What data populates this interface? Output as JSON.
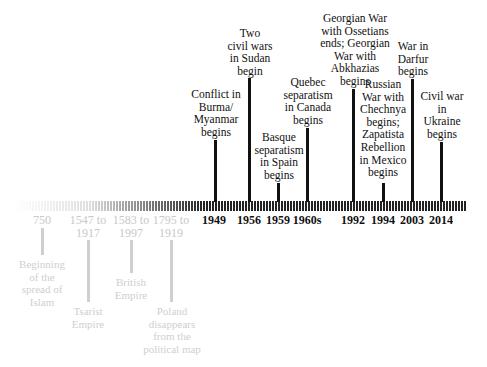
{
  "colors": {
    "dark": "#111111",
    "faded": "#c8c8c8",
    "bar": "#222222"
  },
  "modern_events": [
    {
      "year": "1949",
      "label": "Conflict in\nBurma/\nMyanmar\nbegins"
    },
    {
      "year": "1956",
      "label": "Two\ncivil wars\nin Sudan\nbegin"
    },
    {
      "year": "1959",
      "label": "Basque\nseparatism\nin Spain\nbegins"
    },
    {
      "year": "1960s",
      "label": "Quebec\nseparatism\nin Canada\nbegins"
    },
    {
      "year": "1992",
      "label": "Georgian War\nwith Ossetians\nends; Georgian\nWar with\nAbkhazias\nbegins"
    },
    {
      "year": "1994",
      "label": "Russian\nWar with\nChechnya\nbegins;\nZapatista\nRebellion\nin Mexico\nbegins"
    },
    {
      "year": "2003",
      "label": "War in\nDarfur\nbegins"
    },
    {
      "year": "2014",
      "label": "Civil war\nin\nUkraine\nbegins"
    }
  ],
  "historical_events": [
    {
      "year": "750",
      "label": "Beginning\nof the\nspread of\nIslam"
    },
    {
      "year": "1547 to\n1917",
      "label": "Tsarist\nEmpire"
    },
    {
      "year": "1583 to\n1997",
      "label": "British\nEmpire"
    },
    {
      "year": "1795 to\n1919",
      "label": "Poland\ndisappears\nfrom the\npolitical map"
    }
  ]
}
